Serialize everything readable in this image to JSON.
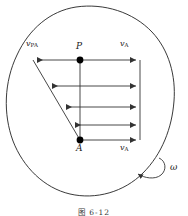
{
  "figure": {
    "caption": "图 6-12",
    "body_outline_name": "rigid-body-outline",
    "colors": {
      "stroke": "#222222",
      "arrow": "#444444",
      "point": "#000000",
      "background": "#ffffff"
    }
  },
  "points": [
    {
      "id": "P",
      "label": "P",
      "x": 80,
      "y": 60,
      "label_x": 76,
      "label_y": 44
    },
    {
      "id": "A",
      "label": "A",
      "x": 80,
      "y": 140,
      "label_x": 76,
      "label_y": 146
    }
  ],
  "vector_labels": [
    {
      "id": "v-PA",
      "symbol": "v",
      "subscript": "PA",
      "x": 28,
      "y": 45
    },
    {
      "id": "v-A-top",
      "symbol": "v",
      "subscript": "A",
      "x": 120,
      "y": 45
    },
    {
      "id": "v-A-bottom",
      "symbol": "v",
      "subscript": "A",
      "x": 120,
      "y": 146
    }
  ],
  "angular_velocity": {
    "symbol": "ω",
    "x": 172,
    "y": 168,
    "arc_name": "rotation-arc-arrow"
  },
  "left_arrows": {
    "description": "relative velocity v_PA arrows, pointing left, decreasing length from P toward A",
    "rows": [
      {
        "y": 60,
        "x_tail": 80,
        "x_head": 33
      },
      {
        "y": 86,
        "x_tail": 80,
        "x_head": 48
      },
      {
        "y": 107,
        "x_tail": 80,
        "x_head": 62
      },
      {
        "y": 125,
        "x_tail": 80,
        "x_head": 72
      }
    ]
  },
  "right_arrows": {
    "description": "translation velocity v_A arrows, pointing right, equal length",
    "rows": [
      {
        "y": 60,
        "x_tail": 80,
        "x_head": 140
      },
      {
        "y": 86,
        "x_tail": 80,
        "x_head": 140
      },
      {
        "y": 107,
        "x_tail": 80,
        "x_head": 140
      },
      {
        "y": 125,
        "x_tail": 80,
        "x_head": 140
      },
      {
        "y": 140,
        "x_tail": 80,
        "x_head": 140
      }
    ]
  },
  "vertical_axis": {
    "x": 80,
    "y_top": 60,
    "y_bottom": 140
  },
  "right_axis": {
    "x": 140,
    "y_top": 60,
    "y_bottom": 140
  },
  "envelope_line": {
    "x1": 33,
    "y1": 60,
    "x2": 80,
    "y2": 140
  }
}
